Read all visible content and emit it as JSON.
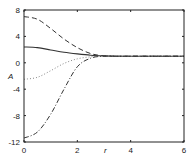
{
  "chart_data": {
    "type": "line",
    "title": "",
    "xlabel": "r",
    "ylabel": "A",
    "xlim": [
      0,
      6
    ],
    "ylim": [
      -12,
      8
    ],
    "xticks": [
      0,
      2,
      4,
      6
    ],
    "yticks": [
      8,
      4,
      0,
      -4,
      -8,
      -12
    ],
    "xtick_labels": [
      "0",
      "2",
      "4",
      "6"
    ],
    "ytick_labels": [
      "8",
      "4",
      "0",
      "-4",
      "-8",
      "-12"
    ],
    "grid": false,
    "legend": null,
    "series": [
      {
        "name": "solid",
        "style": "solid",
        "x": [
          0,
          0.5,
          1.0,
          1.5,
          2.0,
          2.5,
          3.0,
          3.5,
          4.0,
          5.0,
          6.0
        ],
        "y": [
          2.4,
          2.3,
          1.95,
          1.6,
          1.35,
          1.15,
          1.05,
          1.0,
          1.0,
          1.0,
          1.0
        ]
      },
      {
        "name": "dashed",
        "style": "dashed",
        "x": [
          0,
          0.5,
          1.0,
          1.5,
          2.0,
          2.5,
          3.0,
          3.5,
          4.0,
          5.0,
          6.0
        ],
        "y": [
          7.0,
          6.6,
          5.2,
          3.6,
          2.3,
          1.4,
          1.05,
          1.0,
          1.0,
          1.0,
          1.0
        ]
      },
      {
        "name": "dotted",
        "style": "dotted",
        "x": [
          0,
          0.5,
          1.0,
          1.5,
          2.0,
          2.5,
          3.0,
          3.5,
          4.0,
          5.0,
          6.0
        ],
        "y": [
          -2.5,
          -2.2,
          -1.2,
          -0.1,
          0.6,
          0.9,
          1.0,
          1.0,
          1.0,
          1.0,
          1.0
        ]
      },
      {
        "name": "dash-dot",
        "style": "dashdot",
        "x": [
          0,
          0.5,
          1.0,
          1.5,
          2.0,
          2.5,
          3.0,
          3.5,
          4.0,
          5.0,
          6.0
        ],
        "y": [
          -11.4,
          -10.5,
          -7.8,
          -4.0,
          -0.6,
          0.7,
          1.0,
          1.0,
          1.0,
          1.0,
          1.0
        ]
      }
    ]
  }
}
